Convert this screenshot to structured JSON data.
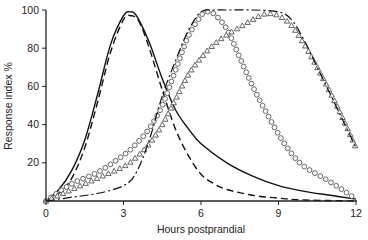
{
  "chart_data": {
    "type": "line",
    "title": "",
    "xlabel": "Hours postprandial",
    "ylabel": "Response index %",
    "xlim": [
      0,
      12
    ],
    "ylim": [
      0,
      100
    ],
    "xticks": [
      0,
      3,
      6,
      9,
      12
    ],
    "yticks": [
      20,
      40,
      60,
      80,
      100
    ],
    "grid": false,
    "legend": "none",
    "series": [
      {
        "name": "solid",
        "style": "solid",
        "x": [
          0,
          0.5,
          1,
          1.5,
          2,
          2.5,
          3,
          3.25,
          3.5,
          4,
          4.5,
          5,
          5.5,
          6,
          7,
          8,
          9,
          10,
          11,
          12
        ],
        "y": [
          0,
          6,
          16,
          32,
          56,
          82,
          97,
          99,
          97,
          83,
          64,
          48,
          38,
          30,
          20,
          13,
          8,
          5,
          3,
          1
        ]
      },
      {
        "name": "dashed",
        "style": "dashed",
        "x": [
          0,
          0.5,
          1,
          1.5,
          2,
          2.5,
          3,
          3.3,
          3.6,
          4,
          4.5,
          5,
          5.5,
          6,
          6.5,
          7,
          8,
          9,
          10,
          12
        ],
        "y": [
          0,
          4,
          12,
          28,
          52,
          78,
          95,
          97,
          94,
          80,
          58,
          38,
          24,
          14,
          9,
          6,
          3,
          1.5,
          0.5,
          0
        ]
      },
      {
        "name": "circles",
        "style": "marker-circle",
        "x": [
          0,
          1,
          2,
          3,
          3.5,
          4,
          4.5,
          5,
          5.5,
          6,
          6.2,
          6.5,
          7,
          7.5,
          8,
          8.5,
          9,
          9.5,
          10,
          11,
          12
        ],
        "y": [
          0,
          9,
          15,
          24,
          30,
          38,
          50,
          68,
          86,
          97,
          99,
          98,
          90,
          75,
          60,
          47,
          35,
          25,
          18,
          10,
          1
        ]
      },
      {
        "name": "triangles",
        "style": "marker-triangle",
        "x": [
          0,
          1,
          2,
          3,
          3.5,
          4,
          4.5,
          5,
          5.5,
          6,
          6.5,
          7,
          7.5,
          8,
          8.5,
          9,
          9.5,
          10,
          10.5,
          11,
          11.5,
          12
        ],
        "y": [
          0,
          6,
          12,
          18,
          23,
          30,
          40,
          53,
          66,
          75,
          82,
          87,
          91,
          95,
          98,
          97,
          92,
          82,
          70,
          57,
          43,
          28
        ]
      },
      {
        "name": "dash-dot",
        "style": "dash-dot",
        "x": [
          0,
          1,
          2,
          3,
          3.5,
          4,
          4.5,
          5,
          5.5,
          6,
          6.5,
          7,
          8,
          9,
          9.5,
          10,
          10.5,
          11,
          11.5,
          12
        ],
        "y": [
          0,
          2,
          4,
          8,
          15,
          32,
          55,
          73,
          89,
          99,
          100,
          100,
          100,
          99,
          95,
          84,
          70,
          56,
          42,
          28
        ]
      }
    ]
  }
}
